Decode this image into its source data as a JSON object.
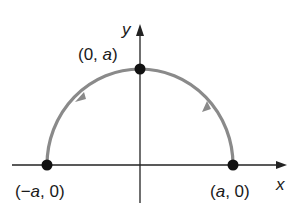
{
  "diagram": {
    "axes": {
      "x_label": "x",
      "y_label": "y"
    },
    "points": [
      {
        "id": "left",
        "label_prefix": "(−",
        "label_var": "a",
        "label_suffix": ", 0)"
      },
      {
        "id": "top",
        "label_prefix": "(0, ",
        "label_var": "a",
        "label_suffix": ")"
      },
      {
        "id": "right",
        "label_prefix": "(",
        "label_var": "a",
        "label_suffix": ", 0)"
      }
    ],
    "curve": {
      "description": "upper semicircle of radius a traversed counterclockwise",
      "color": "#8a8a8a"
    },
    "colors": {
      "axis": "#222222",
      "point": "#111111",
      "curve": "#8a8a8a"
    }
  }
}
